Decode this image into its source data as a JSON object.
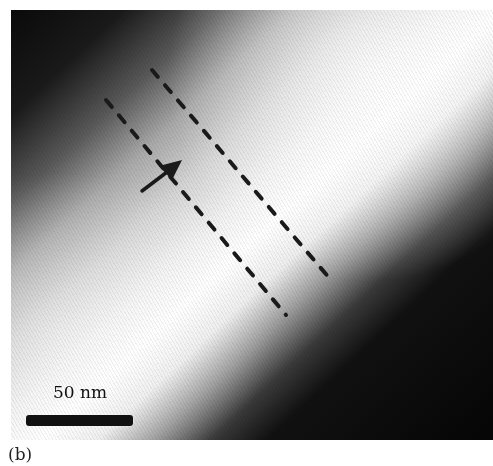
{
  "figure": {
    "panel_label": "(b)",
    "scale_bar": {
      "label": "50 nm",
      "color": "#111111"
    },
    "annotations": {
      "dashed_lines": 2,
      "arrow": "arrow-pointing-up-right",
      "line_color": "#1a1a1a"
    }
  }
}
